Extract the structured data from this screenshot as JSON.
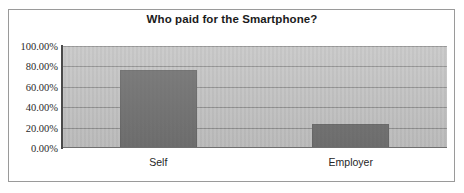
{
  "chart_data": {
    "type": "bar",
    "title": "Who paid for the Smartphone?",
    "xlabel": "",
    "ylabel": "",
    "categories": [
      "Self",
      "Employer"
    ],
    "values": [
      76.5,
      23.5
    ],
    "value_labels": [
      "76.50%",
      "23.50%"
    ],
    "ylim": [
      0,
      100
    ],
    "ytick_values": [
      0,
      20,
      40,
      60,
      80,
      100
    ],
    "ytick_labels": [
      "0.00%",
      "20.00%",
      "40.00%",
      "60.00%",
      "80.00%",
      "100.00%"
    ],
    "grid": true,
    "grid_axis": "y",
    "legend": false,
    "legend_position": "none",
    "bar_color": "#6e6e6e",
    "plot_background": "#c3c3c3",
    "gridline_color": "#8f8f8f",
    "axis_color": "#4a4a4a",
    "frame_color": "#9a9a9a",
    "title_color": "#1b1b1b",
    "tick_label_color": "#2a2a2a"
  }
}
